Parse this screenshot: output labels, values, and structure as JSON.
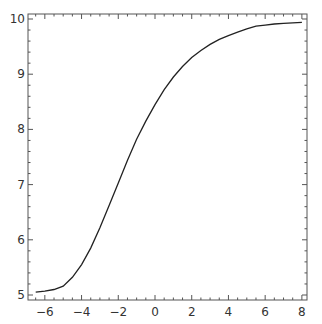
{
  "chart_data": {
    "type": "line",
    "title": "",
    "xlabel": "",
    "ylabel": "",
    "xlim": [
      -6.9,
      8.3
    ],
    "ylim": [
      4.9,
      10.1
    ],
    "grid": false,
    "legend": null,
    "x_ticks": [
      "-6",
      "-4",
      "-2",
      "0",
      "2",
      "4",
      "6",
      "8"
    ],
    "y_ticks": [
      "5",
      "6",
      "7",
      "8",
      "9",
      "10"
    ],
    "series": [
      {
        "name": "curve",
        "x": [
          -6.5,
          -6.0,
          -5.5,
          -5.0,
          -4.5,
          -4.0,
          -3.5,
          -3.0,
          -2.5,
          -2.0,
          -1.5,
          -1.0,
          -0.5,
          0.0,
          0.5,
          1.0,
          1.5,
          2.0,
          2.5,
          3.0,
          3.5,
          4.0,
          4.5,
          5.0,
          5.5,
          6.0,
          6.5,
          7.0,
          7.5,
          8.0
        ],
        "y": [
          5.05,
          5.07,
          5.1,
          5.16,
          5.32,
          5.55,
          5.85,
          6.22,
          6.62,
          7.03,
          7.44,
          7.82,
          8.15,
          8.45,
          8.72,
          8.95,
          9.14,
          9.3,
          9.43,
          9.54,
          9.63,
          9.7,
          9.76,
          9.82,
          9.87,
          9.89,
          9.91,
          9.92,
          9.93,
          9.94
        ]
      }
    ]
  }
}
